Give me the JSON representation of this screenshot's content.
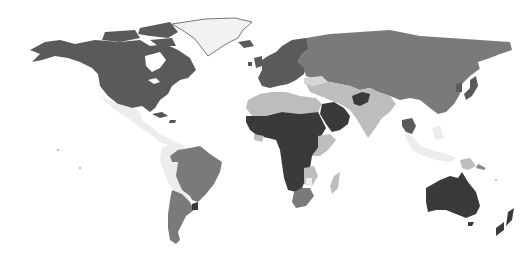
{
  "map": {
    "type": "choropleth",
    "projection": "equirectangular-like world map",
    "background": "#ffffff",
    "legend": null,
    "title": null,
    "shade_scale": {
      "very_light": "#ececec",
      "light": "#bdbdbd",
      "medium": "#7a7a7a",
      "medium_dark": "#5a5a5a",
      "dark": "#3a3a3a"
    },
    "regions": [
      {
        "name": "canada-usa",
        "shade": "medium_dark"
      },
      {
        "name": "greenland",
        "shade": "very_light"
      },
      {
        "name": "mexico-central-america-caribbean",
        "shade": "very_light"
      },
      {
        "name": "brazil",
        "shade": "medium"
      },
      {
        "name": "andean-south-america",
        "shade": "very_light"
      },
      {
        "name": "southern-cone",
        "shade": "medium"
      },
      {
        "name": "uruguay",
        "shade": "dark"
      },
      {
        "name": "europe",
        "shade": "medium_dark"
      },
      {
        "name": "russia-central-asia-china",
        "shade": "medium"
      },
      {
        "name": "north-africa",
        "shade": "light"
      },
      {
        "name": "sub-saharan-africa",
        "shade": "dark"
      },
      {
        "name": "east-africa",
        "shade": "light"
      },
      {
        "name": "southern-africa",
        "shade": "medium"
      },
      {
        "name": "madagascar",
        "shade": "light"
      },
      {
        "name": "arabian-peninsula",
        "shade": "dark"
      },
      {
        "name": "middle-east-south-asia",
        "shade": "light"
      },
      {
        "name": "afghanistan",
        "shade": "dark"
      },
      {
        "name": "southeast-asia",
        "shade": "very_light"
      },
      {
        "name": "thailand-indochina",
        "shade": "medium_dark"
      },
      {
        "name": "japan-korea",
        "shade": "medium_dark"
      },
      {
        "name": "papua-new-guinea",
        "shade": "light"
      },
      {
        "name": "australia",
        "shade": "dark"
      },
      {
        "name": "new-zealand",
        "shade": "dark"
      }
    ]
  }
}
